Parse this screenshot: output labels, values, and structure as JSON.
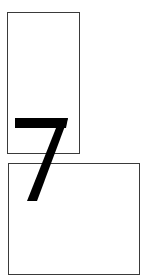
{
  "figure": {
    "glyph": {
      "character": "7",
      "color": "#000000"
    },
    "boxes": [
      {
        "id": "top",
        "shape": "tall rectangle",
        "border_color": "#3a3a3a"
      },
      {
        "id": "bottom",
        "shape": "wide rectangle",
        "border_color": "#3a3a3a"
      }
    ],
    "background": "#ffffff"
  }
}
